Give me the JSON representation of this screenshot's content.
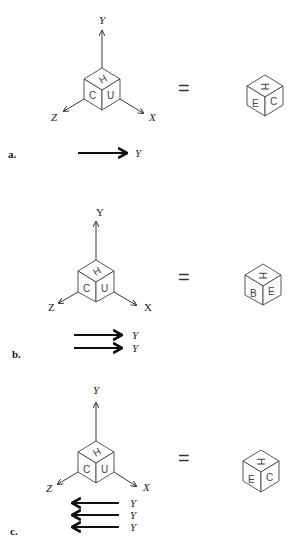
{
  "panels": [
    {
      "tag": "a.",
      "axes": {
        "y": "Y",
        "x": "X",
        "z": "Z"
      },
      "cube_left": {
        "top": "H",
        "left": "C",
        "right": "U"
      },
      "equals": "=",
      "cube_right": {
        "top": "H",
        "left": "E",
        "right": "C"
      },
      "rotations": [
        {
          "direction": "right",
          "axis": "Y"
        }
      ]
    },
    {
      "tag": "b.",
      "axes": {
        "y": "Y",
        "x": "X",
        "z": "Z"
      },
      "cube_left": {
        "top": "H",
        "left": "C",
        "right": "U"
      },
      "equals": "=",
      "cube_right": {
        "top": "H",
        "left": "B",
        "right": "E"
      },
      "rotations": [
        {
          "direction": "right",
          "axis": "Y"
        },
        {
          "direction": "right",
          "axis": "Y"
        }
      ]
    },
    {
      "tag": "c.",
      "axes": {
        "y": "Y",
        "x": "X",
        "z": "Z"
      },
      "cube_left": {
        "top": "H",
        "left": "C",
        "right": "U"
      },
      "equals": "=",
      "cube_right": {
        "top": "H",
        "left": "E",
        "right": "C"
      },
      "rotations": [
        {
          "direction": "left",
          "axis": "Y"
        },
        {
          "direction": "left",
          "axis": "Y"
        },
        {
          "direction": "left",
          "axis": "Y"
        }
      ]
    }
  ]
}
